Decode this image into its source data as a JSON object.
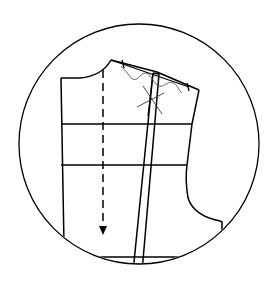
{
  "diagram": {
    "title": "Bodice front pattern with shoulder seam adjustment",
    "type": "sewing-pattern-draft",
    "colors": {
      "stroke": "#000000",
      "thin_stroke": "#333333",
      "background": "#ffffff"
    },
    "elements": {
      "frame": "circle-frame",
      "bodice_outline": "bodice-outline",
      "grainline": "grainline-arrow",
      "horizontal_guides": [
        "chest-line",
        "waist-line",
        "hem-line"
      ],
      "dart": "vertical-dart",
      "shoulder_mark": "shoulder-cross-mark",
      "wavy_lines": "shoulder-ease-lines"
    }
  }
}
